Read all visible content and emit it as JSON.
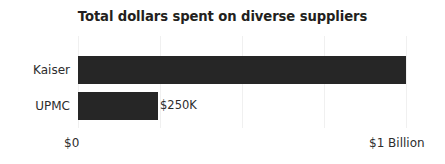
{
  "chart_data": {
    "type": "bar",
    "orientation": "horizontal",
    "title": "Total dollars spent on diverse suppliers",
    "xlabel": "",
    "ylabel": "",
    "categories": [
      "Kaiser",
      "UPMC"
    ],
    "values": [
      1000000000,
      250000
    ],
    "value_labels": [
      "",
      "$250K"
    ],
    "xlim": [
      0,
      1000000000
    ],
    "xticks": [
      0,
      250000000,
      500000000,
      750000000,
      1000000000
    ],
    "xticklabels_shown": [
      "$0",
      "$1 Billion"
    ],
    "xtick_left_label": "$0",
    "xtick_right_label": "$1 Billion",
    "grid": true,
    "gridline_count": 5,
    "legend": "none",
    "bar_fractions": [
      1.0,
      0.2439
    ],
    "bars": [
      {
        "category": "Kaiser",
        "value": 1000000000,
        "fraction": 1.0,
        "label": ""
      },
      {
        "category": "UPMC",
        "value": 250000,
        "fraction": 0.2439,
        "label": "$250K"
      }
    ],
    "colors": {
      "bar": "#262626",
      "gridline": "#f0f0f0",
      "title_text": "#231f20",
      "label_text": "#2d2d2d",
      "background": "#ffffff"
    }
  }
}
